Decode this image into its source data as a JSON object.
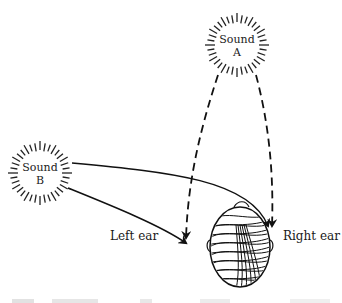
{
  "figure": {
    "sources": [
      {
        "id": "A",
        "line1": "Sound",
        "line2": "A",
        "cx": 237,
        "cy": 45,
        "r": 30
      },
      {
        "id": "B",
        "line1": "Sound",
        "line2": "B",
        "cx": 40,
        "cy": 173,
        "r": 30
      }
    ],
    "labels": {
      "left_ear": "Left ear",
      "right_ear": "Right ear"
    },
    "paths": {
      "A_to_left": "dashed",
      "A_to_right": "dashed",
      "B_to_left": "solid",
      "B_to_right": "solid"
    },
    "caption_clipped": true
  }
}
